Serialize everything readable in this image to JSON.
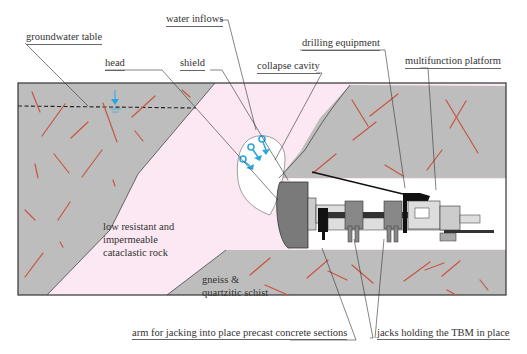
{
  "diagram": {
    "labels": {
      "groundwater_table": "groundwater table",
      "water_inflows": "water inflows",
      "head": "head",
      "shield": "shield",
      "collapse_cavity": "collapse cavity",
      "drilling_equipment": "drilling equipment",
      "multifunction_platform": "multifunction platform",
      "arm_jacking": "arm for jacking into place precast concrete sections",
      "jacks_holding": "jacks holding the TBM in place"
    },
    "regions": {
      "cataclastic_line1": "low resistant and",
      "cataclastic_line2": "impermeable",
      "cataclastic_line3": "cataclastic rock",
      "gneiss_line1": "gneiss &",
      "gneiss_line2": "quartzitic schist"
    },
    "colors": {
      "rock_gray": "#bdbdbd",
      "fault_pink": "#fbe8f2",
      "fracture_red": "#c9553f",
      "water_blue": "#29a8e0",
      "outline": "#333333"
    }
  }
}
